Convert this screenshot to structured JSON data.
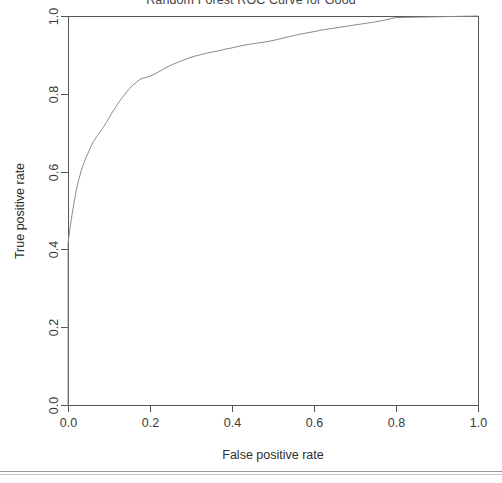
{
  "chart_data": {
    "type": "line",
    "title": "Random Forest ROC Curve for Good",
    "xlabel": "False positive rate",
    "ylabel": "True positive rate",
    "xlim": [
      0,
      1
    ],
    "ylim": [
      0,
      1
    ],
    "grid": false,
    "legend": null,
    "xticks": [
      "0.0",
      "0.2",
      "0.4",
      "0.6",
      "0.8",
      "1.0"
    ],
    "xtick_values": [
      0.0,
      0.2,
      0.4,
      0.6,
      0.8,
      1.0
    ],
    "yticks": [
      "0.0",
      "0.2",
      "0.4",
      "0.6",
      "0.8",
      "1.0"
    ],
    "ytick_values": [
      0.0,
      0.2,
      0.4,
      0.6,
      0.8,
      1.0
    ],
    "series": [
      {
        "name": "ROC curve",
        "color": "#8a8a8a",
        "x": [
          0.0,
          0.0,
          0.002,
          0.004,
          0.006,
          0.008,
          0.01,
          0.012,
          0.014,
          0.016,
          0.018,
          0.02,
          0.023,
          0.026,
          0.029,
          0.032,
          0.035,
          0.038,
          0.041,
          0.044,
          0.047,
          0.05,
          0.054,
          0.058,
          0.062,
          0.066,
          0.07,
          0.074,
          0.078,
          0.082,
          0.086,
          0.09,
          0.095,
          0.1,
          0.105,
          0.11,
          0.115,
          0.12,
          0.126,
          0.132,
          0.138,
          0.144,
          0.15,
          0.158,
          0.166,
          0.174,
          0.182,
          0.19,
          0.2,
          0.21,
          0.22,
          0.232,
          0.244,
          0.256,
          0.268,
          0.28,
          0.295,
          0.31,
          0.325,
          0.34,
          0.355,
          0.37,
          0.385,
          0.4,
          0.42,
          0.44,
          0.46,
          0.48,
          0.5,
          0.52,
          0.54,
          0.56,
          0.58,
          0.6,
          0.625,
          0.65,
          0.675,
          0.7,
          0.725,
          0.75,
          0.775,
          0.8,
          0.85,
          0.9,
          0.95,
          1.0
        ],
        "y": [
          0.0,
          0.415,
          0.432,
          0.448,
          0.462,
          0.476,
          0.49,
          0.503,
          0.516,
          0.528,
          0.54,
          0.551,
          0.565,
          0.578,
          0.59,
          0.601,
          0.612,
          0.62,
          0.628,
          0.636,
          0.643,
          0.65,
          0.66,
          0.669,
          0.677,
          0.683,
          0.69,
          0.696,
          0.702,
          0.708,
          0.714,
          0.72,
          0.729,
          0.738,
          0.747,
          0.756,
          0.764,
          0.772,
          0.781,
          0.79,
          0.798,
          0.806,
          0.813,
          0.822,
          0.829,
          0.836,
          0.84,
          0.842,
          0.845,
          0.85,
          0.856,
          0.863,
          0.87,
          0.876,
          0.881,
          0.886,
          0.892,
          0.897,
          0.901,
          0.905,
          0.908,
          0.911,
          0.915,
          0.918,
          0.923,
          0.927,
          0.93,
          0.933,
          0.937,
          0.942,
          0.947,
          0.952,
          0.956,
          0.96,
          0.965,
          0.969,
          0.973,
          0.977,
          0.981,
          0.985,
          0.99,
          0.996,
          0.997,
          0.998,
          0.999,
          1.0
        ]
      }
    ]
  },
  "geometry": {
    "plot_left": 68,
    "plot_right": 478,
    "plot_top": 16,
    "plot_bottom": 405
  }
}
